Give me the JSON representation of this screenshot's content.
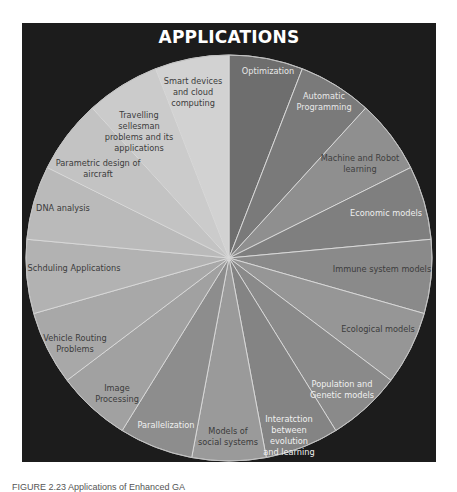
{
  "title": "APPLICATIONS",
  "caption": "FIGURE 2.23   Applications of Enhanced GA",
  "pie": {
    "center": [
      229,
      258
    ],
    "radius": 203,
    "slices": [
      {
        "label": "Optimization",
        "color": "#6e6e6e",
        "text_color": "#e8e8e8",
        "pos": [
          268,
          72
        ]
      },
      {
        "label": "Automatic\nProgramming",
        "color": "#7a7a7a",
        "text_color": "#e8e8e8",
        "pos": [
          324,
          97
        ]
      },
      {
        "label": "Machine and Robot\nlearning",
        "color": "#8f8f8f",
        "text_color": "#404040",
        "pos": [
          360,
          159
        ]
      },
      {
        "label": "Economic models",
        "color": "#7f7f7f",
        "text_color": "#eeeeee",
        "pos": [
          386,
          214
        ]
      },
      {
        "label": "Immune system models",
        "color": "#8a8a8a",
        "text_color": "#3c3c3c",
        "pos": [
          382,
          270
        ]
      },
      {
        "label": "Ecological models",
        "color": "#969696",
        "text_color": "#3c3c3c",
        "pos": [
          378,
          330
        ]
      },
      {
        "label": "Population and\nGenetic models",
        "color": "#8a8a8a",
        "text_color": "#f0f0f0",
        "pos": [
          342,
          385
        ]
      },
      {
        "label": "Interatction\nbetween\nevolution\nand learning",
        "color": "#848484",
        "text_color": "#f0f0f0",
        "pos": [
          289,
          420
        ]
      },
      {
        "label": "Models of\nsocial systems",
        "color": "#9a9a9a",
        "text_color": "#3a3a3a",
        "pos": [
          228,
          432
        ]
      },
      {
        "label": "Parallelization",
        "color": "#8d8d8d",
        "text_color": "#f0f0f0",
        "pos": [
          166,
          426
        ]
      },
      {
        "label": "Image\nProcessing",
        "color": "#a1a1a1",
        "text_color": "#3c3c3c",
        "pos": [
          117,
          389
        ]
      },
      {
        "label": "Vehicle Routing\nProblems",
        "color": "#a8a8a8",
        "text_color": "#3c3c3c",
        "pos": [
          75,
          339
        ]
      },
      {
        "label": "Schduling Applications",
        "color": "#b2b2b2",
        "text_color": "#3c3c3c",
        "pos": [
          74,
          269
        ]
      },
      {
        "label": "DNA analysis",
        "color": "#bababa",
        "text_color": "#3c3c3c",
        "pos": [
          63,
          209
        ]
      },
      {
        "label": "Parametric design of\naircraft",
        "color": "#c3c3c3",
        "text_color": "#3c3c3c",
        "pos": [
          98,
          164
        ]
      },
      {
        "label": "Travelling\nsellesman\nproblems and its\napplications",
        "color": "#cbcbcb",
        "text_color": "#3c3c3c",
        "pos": [
          139,
          116
        ]
      },
      {
        "label": "Smart devices\nand cloud\ncomputing",
        "color": "#d2d2d2",
        "text_color": "#3c3c3c",
        "pos": [
          193,
          82
        ]
      }
    ]
  }
}
